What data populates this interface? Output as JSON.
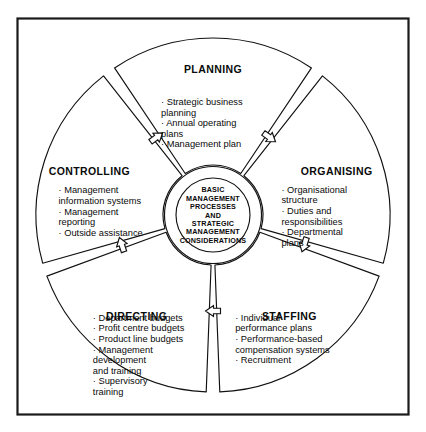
{
  "diagram": {
    "type": "cycle",
    "frame": {
      "border_color": "#1a1a1a",
      "background": "#ffffff"
    },
    "line_color": "#111111",
    "text_color": "#0a0a0a",
    "hub": {
      "name": "basic-management-processes-hub",
      "lines": [
        "BASIC",
        "MANAGEMENT",
        "PROCESSES",
        "AND",
        "STRATEGIC",
        "MANAGEMENT",
        "CONSIDERATIONS"
      ]
    },
    "segments": [
      {
        "id": "planning",
        "label": "PLANNING",
        "bullets": [
          [
            "· Strategic business",
            "   planning"
          ],
          [
            "· Annual operating",
            "   plans"
          ],
          [
            "· Management plan"
          ]
        ]
      },
      {
        "id": "organising",
        "label": "ORGANISING",
        "bullets": [
          [
            "· Organisational",
            "   structure"
          ],
          [
            "· Duties and",
            "   responsibilities"
          ],
          [
            "· Departmental",
            "   plans"
          ]
        ]
      },
      {
        "id": "staffing",
        "label": "STAFFING",
        "bullets": [
          [
            "· Individual",
            "   performance plans"
          ],
          [
            "· Performance-based",
            "   compensation systems"
          ],
          [
            "· Recruitment"
          ]
        ]
      },
      {
        "id": "directing",
        "label": "DIRECTING",
        "bullets": [
          [
            "· Department budgets"
          ],
          [
            "· Profit centre budgets"
          ],
          [
            "· Product line budgets"
          ],
          [
            "· Management",
            "   development",
            "   and training"
          ],
          [
            "· Supervisory",
            "   training"
          ]
        ]
      },
      {
        "id": "controlling",
        "label": "CONTROLLING",
        "bullets": [
          [
            "· Management",
            "   information systems"
          ],
          [
            "· Management",
            "   reporting"
          ],
          [
            "· Outside assistance"
          ]
        ]
      }
    ],
    "arrows": [
      {
        "id": "arrow-controlling-to-planning",
        "between": [
          "controlling",
          "planning"
        ]
      },
      {
        "id": "arrow-planning-to-organising",
        "between": [
          "planning",
          "organising"
        ]
      },
      {
        "id": "arrow-organising-to-staffing",
        "between": [
          "organising",
          "staffing"
        ]
      },
      {
        "id": "arrow-staffing-to-directing",
        "between": [
          "staffing",
          "directing"
        ]
      },
      {
        "id": "arrow-directing-to-controlling",
        "between": [
          "directing",
          "controlling"
        ]
      }
    ]
  }
}
